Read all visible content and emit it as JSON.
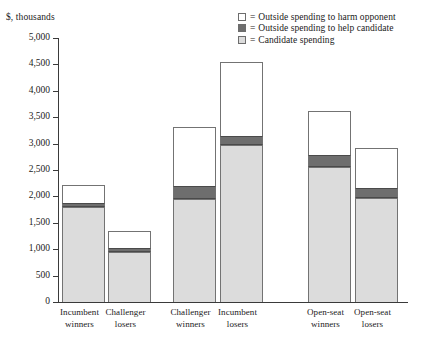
{
  "axis_caption": "$, thousands",
  "legend": {
    "equals": "=",
    "items": [
      {
        "label": "Outside spending to harm opponent",
        "key": "harm",
        "color": "#ffffff"
      },
      {
        "label": "Outside spending to help candidate",
        "key": "help",
        "color": "#6e6e6e"
      },
      {
        "label": "Candidate spending",
        "key": "candidate",
        "color": "#dcdcdc"
      }
    ]
  },
  "y_ticks": [
    "5,000",
    "4,500",
    "4,000",
    "3,500",
    "3,000",
    "2,500",
    "2,000",
    "1,500",
    "1,000",
    "500",
    "0"
  ],
  "chart_data": {
    "type": "bar",
    "title": "",
    "subtitle": "",
    "xlabel": "",
    "ylabel": "$, thousands",
    "ylim": [
      0,
      5000
    ],
    "ytick_step": 500,
    "grid": false,
    "stacked": true,
    "legend_position": "top-right",
    "categories": [
      "Incumbent winners",
      "Challenger losers",
      "Challenger winners",
      "Incumbent losers",
      "Open-seat winners",
      "Open-seat losers"
    ],
    "category_lines": [
      [
        "Incumbent",
        "winners"
      ],
      [
        "Challenger",
        "losers"
      ],
      [
        "Challenger",
        "winners"
      ],
      [
        "Incumbent",
        "losers"
      ],
      [
        "Open-seat",
        "winners"
      ],
      [
        "Open-seat",
        "losers"
      ]
    ],
    "series": [
      {
        "name": "Candidate spending",
        "key": "candidate",
        "color": "#dcdcdc",
        "values": [
          1800,
          950,
          1950,
          2975,
          2555,
          1970
        ]
      },
      {
        "name": "Outside spending to help candidate",
        "key": "help",
        "color": "#6e6e6e",
        "values": [
          75,
          75,
          250,
          170,
          230,
          190
        ]
      },
      {
        "name": "Outside spending to harm opponent",
        "key": "harm",
        "color": "#ffffff",
        "values": [
          341,
          320,
          1114,
          1400,
          832,
          757
        ]
      }
    ],
    "totals": [
      2216,
      1345,
      3314,
      4545,
      3617,
      2917
    ]
  },
  "geometry": {
    "bar_x": [
      4,
      50,
      115,
      162,
      250,
      297
    ],
    "bar_width": 43,
    "label_x": [
      -14,
      32,
      97,
      144,
      232,
      279
    ],
    "label_width": 71
  }
}
